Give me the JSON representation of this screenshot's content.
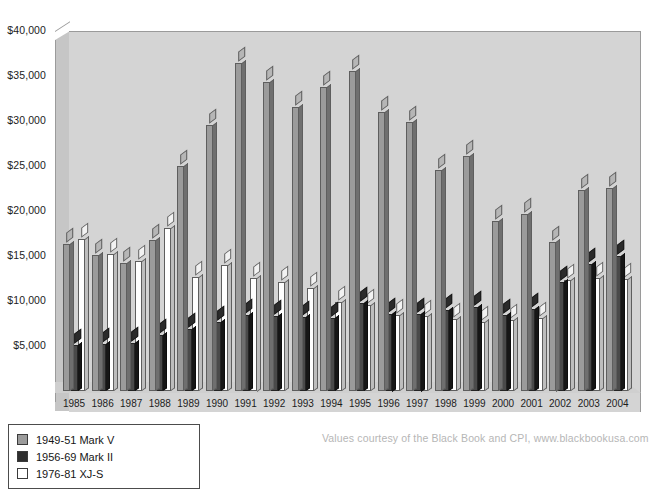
{
  "chart_data": {
    "type": "bar",
    "title": "",
    "subtitle": "",
    "xlabel": "",
    "ylabel": "",
    "grid": false,
    "legend_position": "bottom-left",
    "ylim": [
      0,
      40000
    ],
    "ytick_values": [
      5000,
      10000,
      15000,
      20000,
      25000,
      30000,
      35000,
      40000
    ],
    "ytick_labels": [
      "$5,000",
      "$10,000",
      "$15,000",
      "$20,000",
      "$25,000",
      "$30,000",
      "$35,000",
      "$40,000"
    ],
    "categories": [
      "1985",
      "1986",
      "1987",
      "1988",
      "1989",
      "1990",
      "1991",
      "1992",
      "1993",
      "1994",
      "1995",
      "1996",
      "1997",
      "1998",
      "1999",
      "2000",
      "2001",
      "2002",
      "2003",
      "2004"
    ],
    "series": [
      {
        "name": "1949-51 Mark V",
        "color": "#9b9b9b",
        "values": [
          16200,
          15000,
          14100,
          16700,
          24900,
          29400,
          36300,
          34200,
          31400,
          33700,
          35400,
          30900,
          29800,
          24400,
          26000,
          18800,
          19600,
          16500,
          22200,
          22400
        ]
      },
      {
        "name": "1956-69 Mark II",
        "color": "#2e2e2e",
        "values": [
          5000,
          5100,
          5200,
          6100,
          6800,
          7600,
          8300,
          8200,
          8100,
          8000,
          9700,
          8500,
          8500,
          8900,
          9200,
          8300,
          9000,
          12000,
          14000,
          14900
        ]
      },
      {
        "name": "1976-81 XJ-S",
        "color": "#ffffff",
        "values": [
          16800,
          15100,
          14300,
          18000,
          12600,
          13900,
          12500,
          12000,
          11300,
          9800,
          9400,
          8300,
          8200,
          7900,
          7600,
          7800,
          8000,
          12200,
          12400,
          12300
        ]
      }
    ],
    "annotations": {
      "credit": "Values courtesy of the Black Book and CPI, www.blackbookusa.com"
    }
  }
}
